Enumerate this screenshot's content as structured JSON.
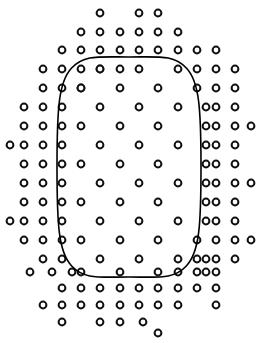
{
  "figure": {
    "name": "texture-density-segregation-stimulus",
    "width": 258,
    "height": 343,
    "background_color": "#ffffff"
  },
  "marker_style": {
    "shape": "open-circle",
    "outer_radius": 4.4,
    "ring_width": 2.0,
    "ring_color": "#111111",
    "fill_color": "#ffffff"
  },
  "contour": {
    "name": "superellipse-boundary",
    "stroke_color": "#000000",
    "stroke_width": 1.6,
    "center_x": 129,
    "center_y": 167,
    "semi_axis_x": 72,
    "semi_axis_y": 110,
    "exponent": 3.2,
    "path": "M 201.0 167.0 C 201.0 225.0 199.4 252.0 186.6 265.7 C 173.8 279.4 160.0 277.0 129.0 277.0 C 98.0 277.0 84.2 279.4 71.4 265.7 C 58.6 252.0 57.0 225.0 57.0 167.0 C 57.0 109.0 58.6 82.0 71.4 68.3 C 84.2 54.6 98.0 57.0 129.0 57.0 C 160.0 57.0 173.8 54.6 186.6 68.3 C 199.4 82.0 201.0 109.0 201.0 167.0 Z"
  },
  "outer_lattice": {
    "name": "coarse-surround-dots",
    "column_pitch": 19.3,
    "row_pitch": 19.3,
    "stagger": "half-pitch-alternating-rows",
    "field_shape": "ellipse",
    "field_center_x": 129,
    "field_center_y": 170,
    "field_radius_x": 126,
    "field_radius_y": 166,
    "relative_density": "2x",
    "points": [
      [
        100,
        13
      ],
      [
        139,
        13
      ],
      [
        158,
        13
      ],
      [
        81,
        32
      ],
      [
        100,
        32
      ],
      [
        120,
        32
      ],
      [
        139,
        32
      ],
      [
        158,
        32
      ],
      [
        178,
        32
      ],
      [
        62,
        50
      ],
      [
        81,
        50
      ],
      [
        100,
        50
      ],
      [
        120,
        50
      ],
      [
        139,
        50
      ],
      [
        158,
        50
      ],
      [
        178,
        50
      ],
      [
        197,
        50
      ],
      [
        216,
        50
      ],
      [
        43,
        69
      ],
      [
        62,
        69
      ],
      [
        81,
        69
      ],
      [
        100,
        69
      ],
      [
        120,
        69
      ],
      [
        178,
        69
      ],
      [
        197,
        69
      ],
      [
        216,
        69
      ],
      [
        235,
        69
      ],
      [
        43,
        88
      ],
      [
        62,
        88
      ],
      [
        81,
        88
      ],
      [
        197,
        88
      ],
      [
        216,
        88
      ],
      [
        235,
        88
      ],
      [
        24,
        107
      ],
      [
        43,
        107
      ],
      [
        62,
        107
      ],
      [
        206,
        107
      ],
      [
        216,
        107
      ],
      [
        235,
        107
      ],
      [
        24,
        126
      ],
      [
        43,
        126
      ],
      [
        62,
        126
      ],
      [
        206,
        126
      ],
      [
        216,
        126
      ],
      [
        235,
        126
      ],
      [
        251,
        126
      ],
      [
        10,
        145
      ],
      [
        24,
        145
      ],
      [
        43,
        145
      ],
      [
        62,
        145
      ],
      [
        206,
        145
      ],
      [
        216,
        145
      ],
      [
        235,
        145
      ],
      [
        24,
        164
      ],
      [
        43,
        164
      ],
      [
        62,
        164
      ],
      [
        206,
        164
      ],
      [
        216,
        164
      ],
      [
        235,
        164
      ],
      [
        24,
        183
      ],
      [
        43,
        183
      ],
      [
        62,
        183
      ],
      [
        206,
        183
      ],
      [
        216,
        183
      ],
      [
        235,
        183
      ],
      [
        251,
        183
      ],
      [
        24,
        202
      ],
      [
        43,
        202
      ],
      [
        62,
        202
      ],
      [
        206,
        202
      ],
      [
        216,
        202
      ],
      [
        235,
        202
      ],
      [
        10,
        221
      ],
      [
        24,
        221
      ],
      [
        43,
        221
      ],
      [
        62,
        221
      ],
      [
        206,
        221
      ],
      [
        216,
        221
      ],
      [
        235,
        221
      ],
      [
        24,
        240
      ],
      [
        43,
        240
      ],
      [
        62,
        240
      ],
      [
        197,
        240
      ],
      [
        216,
        240
      ],
      [
        235,
        240
      ],
      [
        251,
        240
      ],
      [
        43,
        259
      ],
      [
        62,
        259
      ],
      [
        197,
        259
      ],
      [
        206,
        259
      ],
      [
        216,
        259
      ],
      [
        235,
        259
      ],
      [
        30,
        272
      ],
      [
        52,
        272
      ],
      [
        72,
        272
      ],
      [
        81,
        272
      ],
      [
        178,
        272
      ],
      [
        197,
        272
      ],
      [
        206,
        272
      ],
      [
        216,
        272
      ],
      [
        62,
        288
      ],
      [
        81,
        288
      ],
      [
        100,
        288
      ],
      [
        120,
        288
      ],
      [
        139,
        288
      ],
      [
        158,
        288
      ],
      [
        178,
        288
      ],
      [
        197,
        288
      ],
      [
        216,
        288
      ],
      [
        43,
        305
      ],
      [
        62,
        305
      ],
      [
        81,
        305
      ],
      [
        100,
        305
      ],
      [
        120,
        305
      ],
      [
        139,
        305
      ],
      [
        158,
        305
      ],
      [
        178,
        305
      ],
      [
        216,
        305
      ],
      [
        62,
        322
      ],
      [
        100,
        322
      ],
      [
        120,
        322
      ],
      [
        143,
        322
      ],
      [
        158,
        333
      ]
    ]
  },
  "inner_lattice": {
    "name": "fine-interior-dots",
    "column_pitch": 38.6,
    "row_pitch": 19.3,
    "stagger": "half-pitch-alternating-rows",
    "relative_density": "1x",
    "points": [
      [
        100,
        69
      ],
      [
        139,
        69
      ],
      [
        81,
        88
      ],
      [
        120,
        88
      ],
      [
        158,
        88
      ],
      [
        100,
        107
      ],
      [
        139,
        107
      ],
      [
        178,
        107
      ],
      [
        81,
        126
      ],
      [
        120,
        126
      ],
      [
        158,
        126
      ],
      [
        100,
        145
      ],
      [
        139,
        145
      ],
      [
        178,
        145
      ],
      [
        81,
        164
      ],
      [
        120,
        164
      ],
      [
        158,
        164
      ],
      [
        100,
        183
      ],
      [
        139,
        183
      ],
      [
        178,
        183
      ],
      [
        81,
        202
      ],
      [
        120,
        202
      ],
      [
        158,
        202
      ],
      [
        100,
        221
      ],
      [
        139,
        221
      ],
      [
        178,
        221
      ],
      [
        81,
        240
      ],
      [
        120,
        240
      ],
      [
        158,
        240
      ],
      [
        100,
        259
      ],
      [
        139,
        259
      ],
      [
        178,
        259
      ],
      [
        120,
        272
      ],
      [
        158,
        272
      ]
    ]
  }
}
